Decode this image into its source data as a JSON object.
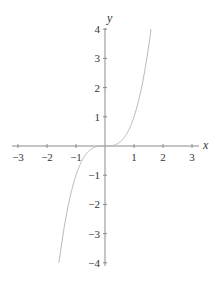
{
  "chart_data": {
    "type": "line",
    "title": "",
    "function": "y = x^3",
    "xlabel": "x",
    "ylabel": "y",
    "xlim": [
      -3,
      3
    ],
    "ylim": [
      -4,
      4
    ],
    "grid": false,
    "legend": null,
    "x_ticks": [
      -3,
      -2,
      -1,
      1,
      2,
      3
    ],
    "x_tick_labels": [
      "−3",
      "−2",
      "−1",
      "1",
      "2",
      "3"
    ],
    "y_ticks": [
      -4,
      -3,
      -2,
      -1,
      1,
      2,
      3,
      4
    ],
    "y_tick_labels": [
      "−4",
      "−3",
      "−2",
      "−1",
      "1",
      "2",
      "3",
      "4"
    ],
    "series": [
      {
        "name": "y = x^3",
        "x": [
          -1.587,
          -1.5,
          -1.25,
          -1.0,
          -0.75,
          -0.5,
          -0.25,
          0,
          0.25,
          0.5,
          0.75,
          1.0,
          1.25,
          1.5,
          1.587
        ],
        "y": [
          -4.0,
          -3.375,
          -1.953,
          -1.0,
          -0.422,
          -0.125,
          -0.016,
          0,
          0.016,
          0.125,
          0.422,
          1.0,
          1.953,
          3.375,
          4.0
        ]
      }
    ],
    "colors": {
      "axis": "#8a8a8a",
      "curve": "#b8b8b8",
      "text": "#333333"
    }
  },
  "layout": {
    "origin_px": [
      105,
      146
    ],
    "unit_px_x": 29,
    "unit_px_y": 29.2,
    "x_axis_extent_px": [
      12,
      199
    ],
    "y_axis_extent_px": [
      28,
      266
    ]
  }
}
